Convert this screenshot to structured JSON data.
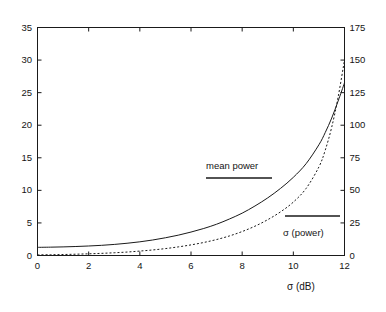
{
  "chart_data": {
    "type": "line",
    "title": "",
    "xlabel": "σ (dB)",
    "ylabel_left": "",
    "ylabel_right": "",
    "xlim": [
      0,
      12
    ],
    "ylim_left": [
      0,
      35
    ],
    "ylim_right": [
      0,
      175
    ],
    "grid": false,
    "legend_position": "inside-annotations",
    "xticks": [
      "0",
      "2",
      "4",
      "6",
      "8",
      "10",
      "12"
    ],
    "xtick_values": [
      0,
      2,
      4,
      6,
      8,
      10,
      12
    ],
    "yticks_left": [
      "0",
      "5",
      "10",
      "15",
      "20",
      "25",
      "30",
      "35"
    ],
    "ytick_values_left": [
      0,
      5,
      10,
      15,
      20,
      25,
      30,
      35
    ],
    "yticks_right": [
      "0",
      "25",
      "50",
      "75",
      "100",
      "125",
      "150",
      "175"
    ],
    "ytick_values_right": [
      0,
      25,
      50,
      75,
      100,
      125,
      150,
      175
    ],
    "x": [
      0,
      0.5,
      1,
      1.5,
      2,
      2.5,
      3,
      3.5,
      4,
      4.5,
      5,
      5.5,
      6,
      6.5,
      7,
      7.5,
      8,
      8.5,
      9,
      9.5,
      10,
      10.5,
      11,
      11.25,
      11.5,
      11.75,
      12
    ],
    "series": [
      {
        "name": "mean power",
        "style": "solid",
        "axis": "left",
        "values": [
          1.25,
          1.28,
          1.32,
          1.38,
          1.46,
          1.56,
          1.7,
          1.88,
          2.1,
          2.38,
          2.72,
          3.12,
          3.6,
          4.15,
          4.8,
          5.6,
          6.5,
          7.6,
          8.85,
          10.3,
          12.0,
          14.1,
          17.0,
          18.9,
          21.1,
          23.7,
          26.5
        ]
      },
      {
        "name": "σ (power)",
        "style": "dotted",
        "axis": "left",
        "values": [
          0.1,
          0.12,
          0.15,
          0.2,
          0.26,
          0.33,
          0.42,
          0.53,
          0.68,
          0.85,
          1.06,
          1.32,
          1.63,
          2.0,
          2.45,
          3.0,
          3.68,
          4.5,
          5.5,
          6.7,
          8.2,
          10.3,
          13.6,
          16.2,
          19.7,
          24.3,
          30.0
        ]
      }
    ],
    "annotations": [
      {
        "name": "mean power",
        "text": "mean power",
        "style": "solid",
        "label_x_px": 206,
        "label_y_px": 160,
        "line_x1_px": 206,
        "line_x2_px": 272,
        "line_y_px": 178
      },
      {
        "name": "sigma power",
        "text": "σ (power)",
        "style": "solid",
        "label_x_px": 283,
        "label_y_px": 227,
        "line_x1_px": 285,
        "line_x2_px": 340,
        "line_y_px": 216
      }
    ]
  },
  "axes": {
    "x_title": "σ (dB)",
    "x_tick_labels": [
      "0",
      "2",
      "4",
      "6",
      "8",
      "10",
      "12"
    ],
    "y_left_tick_labels": [
      "0",
      "5",
      "10",
      "15",
      "20",
      "25",
      "30",
      "35"
    ],
    "y_right_tick_labels": [
      "0",
      "25",
      "50",
      "75",
      "100",
      "125",
      "150",
      "175"
    ]
  },
  "style": {
    "frame_color": "#1a1a1a",
    "curve_color": "#1a1a1a",
    "background": "#ffffff"
  }
}
